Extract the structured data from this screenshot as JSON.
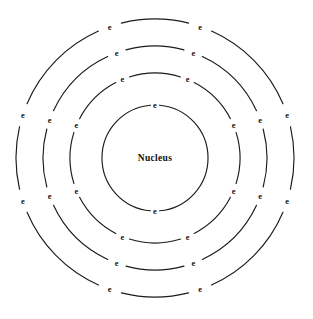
{
  "diagram": {
    "type": "bohr-atomic-model",
    "title": "",
    "background_color": "#ffffff",
    "line_color": "#1a1a1a",
    "text_color": "#111111",
    "canvas": {
      "width": 313,
      "height": 319
    },
    "center": {
      "x": 155,
      "y": 158
    },
    "nucleus": {
      "label": "Nucleus",
      "label_x": 155,
      "label_y": 158
    },
    "shells": [
      {
        "name": "shell-1",
        "index": 1,
        "radius": 53,
        "electron_count": 2,
        "electron_label": "e",
        "electron_angles": [
          180,
          0
        ]
      },
      {
        "name": "shell-2",
        "index": 2,
        "radius": 85,
        "electron_count": 8,
        "electron_label": "e",
        "electron_angles": [
          247.5,
          292.5,
          337.5,
          22.5,
          67.5,
          112.5,
          157.5,
          202.5
        ]
      },
      {
        "name": "shell-3",
        "index": 3,
        "radius": 112,
        "electron_count": 8,
        "electron_label": "e",
        "electron_angles": [
          250,
          290,
          340,
          20,
          70,
          110,
          160,
          200
        ]
      },
      {
        "name": "shell-4",
        "index": 4,
        "radius": 139,
        "electron_count": 8,
        "electron_label": "e",
        "electron_angles": [
          252,
          288,
          341,
          19,
          72,
          108,
          161,
          199
        ]
      }
    ],
    "electron_gap_degrees": 5.0
  }
}
